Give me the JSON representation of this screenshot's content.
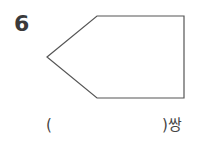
{
  "question": {
    "number": "6",
    "figure": {
      "type": "pentagon",
      "vertices": [
        [
          47,
          57
        ],
        [
          97,
          16
        ],
        [
          184,
          16
        ],
        [
          184,
          98
        ],
        [
          97,
          98
        ]
      ],
      "stroke_color": "#555555"
    },
    "answer_blank": {
      "open_paren": "(",
      "close_paren": ")",
      "unit": "쌍"
    }
  }
}
